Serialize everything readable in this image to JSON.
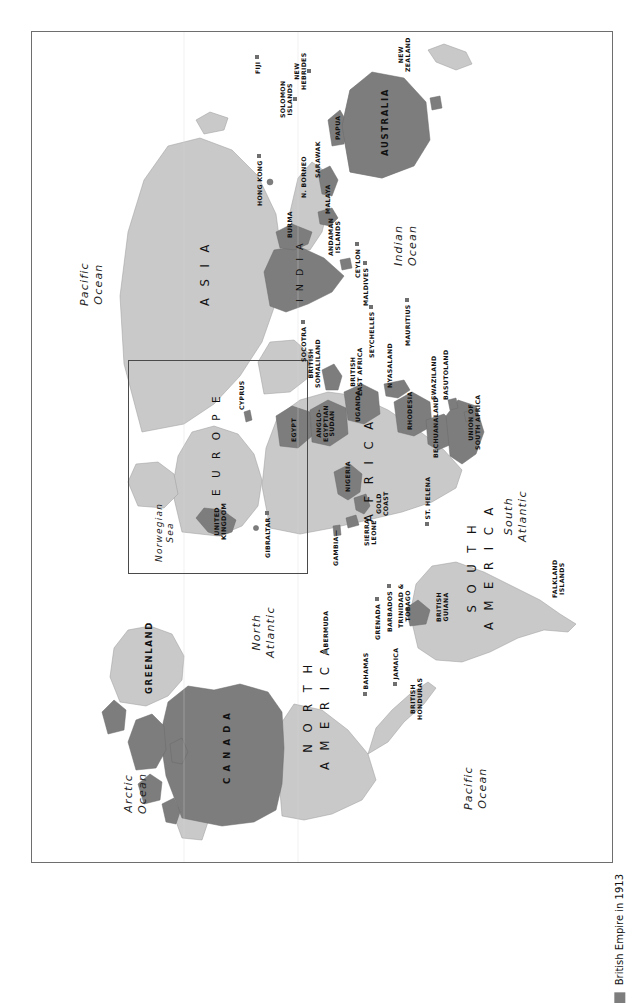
{
  "page": {
    "caption": "MAP 7.1",
    "orientation": "landscape-map-on-portrait-page"
  },
  "legend": {
    "label": "British Empire in 1913",
    "swatch_color": "#7d7d7d"
  },
  "colors": {
    "empire": "#7d7d7d",
    "land": "#c9c9c9",
    "ocean": "#ffffff",
    "frame": "#6e6e6e",
    "inset_border": "#4a4a4a",
    "text": "#1a1a1a"
  },
  "map": {
    "title": "British Empire in 1913",
    "oceans": [
      {
        "name": "Arctic Ocean",
        "line1": "Arctic",
        "line2": "Ocean"
      },
      {
        "name": "Pacific Ocean",
        "line1": "Pacific",
        "line2": "Ocean"
      },
      {
        "name": "North Atlantic",
        "line1": "North",
        "line2": "Atlantic"
      },
      {
        "name": "South Atlantic",
        "line1": "South",
        "line2": "Atlantic"
      },
      {
        "name": "Indian Ocean",
        "line1": "Indian",
        "line2": "Ocean"
      },
      {
        "name": "Norwegian Sea",
        "line1": "Norwegian",
        "line2": "Sea"
      },
      {
        "name": "Arctic Ocean 2",
        "line1": "Arctic",
        "line2": "Ocean"
      },
      {
        "name": "Pacific Ocean 2",
        "line1": "Pacific",
        "line2": "Ocean"
      }
    ],
    "continents": [
      {
        "name": "Asia",
        "label": "A S I A"
      },
      {
        "name": "Europe",
        "label": "E U R O P E"
      },
      {
        "name": "Africa",
        "label": "A F R I C A"
      },
      {
        "name": "North America",
        "line1": "N O R T H",
        "line2": "A M E R I C A"
      },
      {
        "name": "South America",
        "line1": "S O U T H",
        "line2": "A M E R I C A"
      },
      {
        "name": "Greenland",
        "label": "GREENLAND"
      },
      {
        "name": "Australia",
        "label": "AUSTRALIA"
      },
      {
        "name": "Canada",
        "label": "C A N A D A"
      },
      {
        "name": "India",
        "label": "I N D I A"
      }
    ],
    "territories": [
      {
        "name": "Canada",
        "label": "C A N A D A",
        "empire": true
      },
      {
        "name": "Bermuda",
        "label": "BERMUDA",
        "empire": true,
        "dot": true
      },
      {
        "name": "Bahamas",
        "label": "BAHAMAS",
        "empire": true,
        "dot": true
      },
      {
        "name": "Jamaica",
        "label": "JAMAICA",
        "empire": true,
        "dot": true
      },
      {
        "name": "British Honduras",
        "line1": "BRITISH",
        "line2": "HONDURAS",
        "empire": true
      },
      {
        "name": "Grenada",
        "label": "GRENADA",
        "empire": true,
        "dot": true
      },
      {
        "name": "Barbados",
        "label": "BARBADOS",
        "empire": true,
        "dot": true
      },
      {
        "name": "Trinidad & Tobago",
        "line1": "TRINIDAD &",
        "line2": "TOBAGO",
        "empire": true,
        "dot": true
      },
      {
        "name": "British Guiana",
        "line1": "BRITISH",
        "line2": "GUIANA",
        "empire": true
      },
      {
        "name": "Falkland Islands",
        "line1": "FALKLAND",
        "line2": "ISLANDS",
        "empire": true
      },
      {
        "name": "United Kingdom",
        "line1": "UNITED",
        "line2": "KINGDOM",
        "empire": true
      },
      {
        "name": "Gibraltar",
        "label": "GIBRALTAR",
        "empire": true,
        "dot": true
      },
      {
        "name": "Cyprus",
        "label": "CYPRUS",
        "empire": true
      },
      {
        "name": "Gambia",
        "label": "GAMBIA",
        "empire": true
      },
      {
        "name": "Sierra Leone",
        "line1": "SIERRA",
        "line2": "LEONE",
        "empire": true
      },
      {
        "name": "Gold Coast",
        "line1": "GOLD",
        "line2": "COAST",
        "empire": true
      },
      {
        "name": "Nigeria",
        "label": "NIGERIA",
        "empire": true
      },
      {
        "name": "St. Helena",
        "label": "ST. HELENA",
        "empire": true,
        "dot": true
      },
      {
        "name": "Egypt",
        "label": "EGYPT",
        "empire": true
      },
      {
        "name": "Anglo-Egyptian Sudan",
        "line1": "ANGLO-",
        "line2": "EGYPTIAN",
        "line3": "SUDAN",
        "empire": true
      },
      {
        "name": "British Somaliland",
        "line1": "BRITISH",
        "line2": "SOMALILAND",
        "empire": true
      },
      {
        "name": "Uganda",
        "label": "UGANDA",
        "empire": true
      },
      {
        "name": "British East Africa",
        "line1": "BRITISH",
        "line2": "EAST AFRICA",
        "empire": true
      },
      {
        "name": "Nyasaland",
        "label": "NYASALAND",
        "empire": true
      },
      {
        "name": "Rhodesia",
        "label": "RHODESIA",
        "empire": true
      },
      {
        "name": "Bechuanaland",
        "label": "BECHUANALAND",
        "empire": true
      },
      {
        "name": "Swaziland",
        "label": "SWAZILAND",
        "empire": true
      },
      {
        "name": "Basutoland",
        "label": "BASUTOLAND",
        "empire": true
      },
      {
        "name": "Union of South Africa",
        "line1": "UNION OF",
        "line2": "SOUTH AFRICA",
        "empire": true
      },
      {
        "name": "Socotra",
        "label": "SOCOTRA",
        "empire": true,
        "dot": true
      },
      {
        "name": "Seychelles",
        "label": "SEYCHELLES",
        "empire": true,
        "dot": true
      },
      {
        "name": "Mauritius",
        "label": "MAURITIUS",
        "empire": true,
        "dot": true
      },
      {
        "name": "Maldives",
        "label": "MALDIVES",
        "empire": true,
        "dot": true
      },
      {
        "name": "Ceylon",
        "label": "CEYLON",
        "empire": true,
        "dot": true
      },
      {
        "name": "India",
        "label": "I N D I A",
        "empire": true
      },
      {
        "name": "Burma",
        "label": "BURMA",
        "empire": true
      },
      {
        "name": "Andaman Islands",
        "line1": "ANDAMAN",
        "line2": "ISLANDS",
        "empire": true,
        "dot": true
      },
      {
        "name": "Malaya",
        "label": "MALAYA",
        "empire": true
      },
      {
        "name": "North Borneo",
        "label": "N. BORNEO",
        "empire": true
      },
      {
        "name": "Sarawak",
        "label": "SARAWAK",
        "empire": true
      },
      {
        "name": "Hong Kong",
        "label": "HONG KONG",
        "empire": true,
        "dot": true
      },
      {
        "name": "Papua",
        "label": "PAPUA",
        "empire": true
      },
      {
        "name": "Australia",
        "label": "AUSTRALIA",
        "empire": true
      },
      {
        "name": "New Zealand",
        "line1": "NEW",
        "line2": "ZEALAND",
        "empire": true
      },
      {
        "name": "Fiji",
        "label": "FIJI",
        "empire": true,
        "dot": true
      },
      {
        "name": "Solomon Islands",
        "line1": "SOLOMON",
        "line2": "ISLANDS",
        "empire": true,
        "dot": true
      },
      {
        "name": "New Hebrides",
        "line1": "NEW",
        "line2": "HEBRIDES",
        "empire": true,
        "dot": true
      }
    ]
  }
}
